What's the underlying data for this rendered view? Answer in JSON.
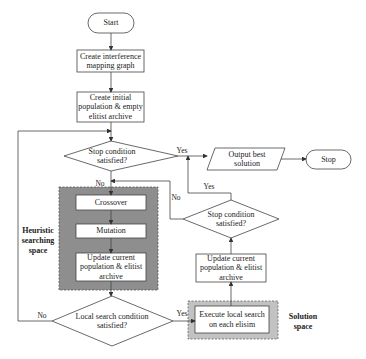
{
  "diagram": {
    "type": "flowchart",
    "nodes": {
      "start": "Start",
      "create_graph": "Create interference mapping graph",
      "create_population": "Create initial population & empty elitist archive",
      "stop_condition_1": "Stop condition satisfied?",
      "output_best": "Output best solution",
      "stop": "Stop",
      "crossover": "Crossover",
      "mutation": "Mutation",
      "update_1": "Update current population & elitist archive",
      "local_search_condition": "Local search condition satisfied?",
      "execute_local_search": "Execute local search on each elisim",
      "update_2": "Update current population & elitist archive",
      "stop_condition_2": "Stop condition satisfied?"
    },
    "regions": {
      "heuristic": "Heuristic searching space",
      "solution": "Solution space"
    },
    "edge_labels": {
      "yes_1": "Yes",
      "no_1": "No",
      "yes_2": "Yes",
      "no_2": "No",
      "yes_3": "Yes",
      "no_3": "No"
    },
    "colors": {
      "region_fill": "#8c8c8c",
      "region_light_fill": "#c4c4c4",
      "line": "#444444"
    }
  }
}
